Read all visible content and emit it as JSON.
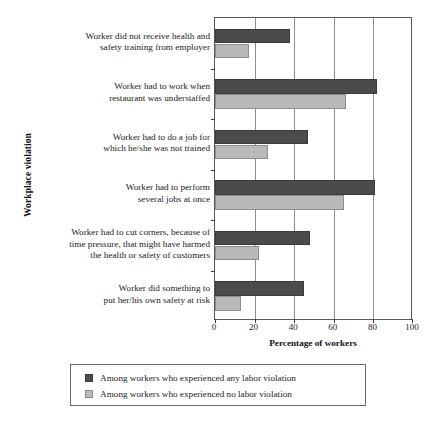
{
  "chart_data": {
    "type": "bar",
    "orientation": "horizontal",
    "title": "",
    "xlabel": "Percentage of workers",
    "ylabel": "Workplace violation",
    "xlim": [
      0,
      100
    ],
    "xticks": [
      0,
      20,
      40,
      60,
      80,
      100
    ],
    "xtick_labels": [
      "0",
      "20",
      "40",
      "60",
      "80",
      "100"
    ],
    "grid": true,
    "legend_position": "below-axes",
    "categories": [
      "Worker did not receive health and safety training from employer",
      "Worker had to work when restaurant was understaffed",
      "Worker had to do a job for which he/she was not trained",
      "Worker had to perform several jobs at once",
      "Worker had to cut corners, because of time pressure, that might have harmed the health or safety of customers",
      "Worker did something to put her/his own safety at risk"
    ],
    "category_lines": [
      [
        "Worker did not receive health and",
        "safety training from employer"
      ],
      [
        "Worker had to work when",
        "restaurant was understaffed"
      ],
      [
        "Worker had to do a job for",
        "which he/she was not trained"
      ],
      [
        "Worker had to perform",
        "several jobs at once"
      ],
      [
        "Worker had to cut corners, because of",
        "time pressure, that might have harmed",
        "the health or safety of customers"
      ],
      [
        "Worker did something to",
        "put her/his own safety at risk"
      ]
    ],
    "series": [
      {
        "name": "Among workers who experienced any labor violation",
        "color": "#4b4b4d",
        "values": [
          38,
          82,
          47,
          81,
          48,
          45
        ]
      },
      {
        "name": "Among workers who experienced no labor violation",
        "color": "#b9b9b9",
        "values": [
          17,
          66,
          27,
          65,
          22,
          13
        ]
      }
    ]
  },
  "legend": {
    "entries": [
      "Among workers who experienced any labor violation",
      "Among workers who experienced no labor violation"
    ]
  }
}
